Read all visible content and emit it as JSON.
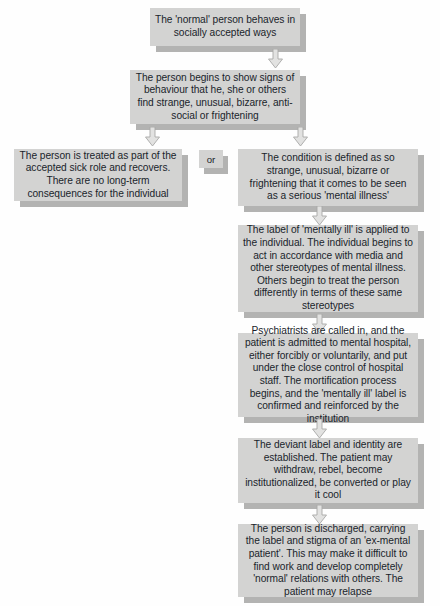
{
  "diagram": {
    "box_fill": "#d3d3d2",
    "shadow_color": "#b3b3b2",
    "text_color": "#1a1f2b",
    "background": "#fefefe",
    "connector_label": "or",
    "nodes": [
      {
        "id": "normal-person",
        "text": "The 'normal' person behaves in socially accepted ways"
      },
      {
        "id": "shows-signs",
        "text": "The person begins to show signs of behaviour that he, she or others find strange, unusual, bizarre, anti-social or frightening"
      },
      {
        "id": "sick-role-recovery",
        "text": "The person is treated as part of the accepted sick role and recovers. There are no long-term consequences for the individual"
      },
      {
        "id": "defined-mental-illness",
        "text": "The condition is defined as so strange, unusual, bizarre or frightening that it comes to be seen as a serious 'mental illness'"
      },
      {
        "id": "label-applied",
        "text": "The label of 'mentally ill' is applied to the individual. The individual begins to act in accordance with media and other stereotypes of mental illness. Others begin to treat the person differently in terms of these same stereotypes"
      },
      {
        "id": "psychiatrists-admission",
        "text": "Psychiatrists are called in, and the patient is admitted to mental hospital, either forcibly or voluntarily, and put under the close control of hospital staff. The mortification process begins, and the 'mentally ill' label is confirmed and reinforced by the institution"
      },
      {
        "id": "deviant-identity",
        "text": "The deviant label and identity are established. The patient may withdraw, rebel, become institutionalized, be converted or play it cool"
      },
      {
        "id": "discharged",
        "text": "The person is discharged, carrying the label and stigma of an 'ex-mental patient'. This may make it difficult to find work and develop completely 'normal' relations with others. The patient may relapse"
      }
    ]
  }
}
